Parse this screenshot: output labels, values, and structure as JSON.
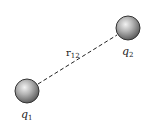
{
  "diagram": {
    "type": "point-charges-distance",
    "charges": [
      {
        "id": "q1",
        "symbol": "q",
        "subscript": "1",
        "cx": 27,
        "cy": 91,
        "r": 12
      },
      {
        "id": "q2",
        "symbol": "q",
        "subscript": "2",
        "cx": 128,
        "cy": 28,
        "r": 12
      }
    ],
    "separation": {
      "symbol": "r",
      "subscript": "12",
      "line_style": "dashed",
      "from": [
        38,
        84
      ],
      "to": [
        117,
        35
      ]
    },
    "colors": {
      "sphere_light": "#e8e8e8",
      "sphere_mid": "#a6a6a6",
      "sphere_dark": "#5e5e5e",
      "outline": "#333333",
      "line": "#222222",
      "text": "#222222"
    }
  }
}
